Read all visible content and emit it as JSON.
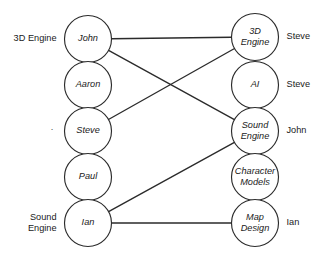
{
  "diagram": {
    "type": "bipartite-assignment-graph",
    "background_color": "#ffffff",
    "stroke_color": "#2b2b2b",
    "text_color": "#1a1a1a",
    "width": 327,
    "height": 254,
    "node_radius": 23.5
  },
  "left_column": {
    "title": "people",
    "nodes": [
      {
        "id": "john",
        "label": "John",
        "cx": 88,
        "cy": 39,
        "side_label": "3D Engine",
        "side_label_lines": [
          "3D Engine"
        ]
      },
      {
        "id": "aaron",
        "label": "Aaron",
        "cx": 88,
        "cy": 85,
        "side_label": "",
        "side_label_lines": []
      },
      {
        "id": "steve",
        "label": "Steve",
        "cx": 88,
        "cy": 131,
        "side_label": "",
        "side_label_lines": []
      },
      {
        "id": "paul",
        "label": "Paul",
        "cx": 88,
        "cy": 177,
        "side_label": "",
        "side_label_lines": []
      },
      {
        "id": "ian",
        "label": "Ian",
        "cx": 88,
        "cy": 223,
        "side_label": "Sound Engine",
        "side_label_lines": [
          "Sound",
          "Engine"
        ]
      }
    ]
  },
  "right_column": {
    "title": "components",
    "nodes": [
      {
        "id": "3d-engine",
        "label": "3D Engine",
        "label_lines": [
          "3D",
          "Engine"
        ],
        "cx": 255,
        "cy": 37,
        "side_label": "Steve"
      },
      {
        "id": "ai",
        "label": "AI",
        "label_lines": [
          "AI"
        ],
        "cx": 255,
        "cy": 85,
        "side_label": "Steve"
      },
      {
        "id": "sound-engine",
        "label": "Sound Engine",
        "label_lines": [
          "Sound",
          "Engine"
        ],
        "cx": 255,
        "cy": 131,
        "side_label": "John"
      },
      {
        "id": "character-models",
        "label": "Character Models",
        "label_lines": [
          "Character",
          "Models"
        ],
        "cx": 255,
        "cy": 177,
        "side_label": ""
      },
      {
        "id": "map-design",
        "label": "Map Design",
        "label_lines": [
          "Map",
          "Design"
        ],
        "cx": 255,
        "cy": 223,
        "side_label": "Ian"
      }
    ]
  },
  "edges": [
    {
      "id": "john-3d-engine",
      "from": "john",
      "to": "3d-engine",
      "from_label": "John",
      "to_label": "3D Engine"
    },
    {
      "id": "john-sound-engine",
      "from": "john",
      "to": "sound-engine",
      "from_label": "John",
      "to_label": "Sound Engine"
    },
    {
      "id": "steve-3d-engine",
      "from": "steve",
      "to": "3d-engine",
      "from_label": "Steve",
      "to_label": "3D Engine"
    },
    {
      "id": "ian-sound-engine",
      "from": "ian",
      "to": "sound-engine",
      "from_label": "Ian",
      "to_label": "Sound Engine"
    },
    {
      "id": "ian-map-design",
      "from": "ian",
      "to": "map-design",
      "from_label": "Ian",
      "to_label": "Map Design"
    }
  ],
  "markers": [
    {
      "id": "steve-row-marker",
      "glyph": "·",
      "x": 52,
      "y": 130
    }
  ]
}
